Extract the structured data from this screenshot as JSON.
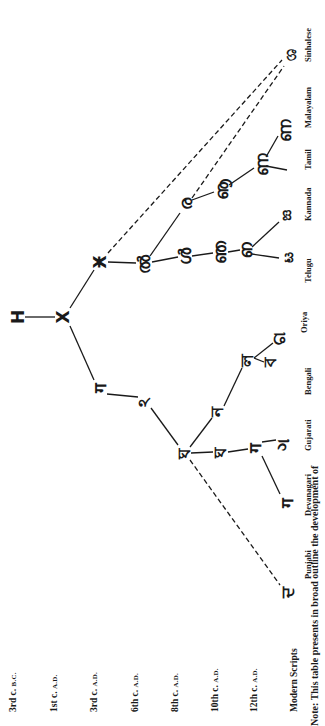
{
  "periods": [
    {
      "era": "3rd c.",
      "suffix": "B.C.",
      "x": 8,
      "y": 712
    },
    {
      "era": "1st c.",
      "suffix": "A.D.",
      "x": 49,
      "y": 712
    },
    {
      "era": "3rd c.",
      "suffix": "A.D.",
      "x": 89,
      "y": 712
    },
    {
      "era": "6th c.",
      "suffix": "A.D.",
      "x": 130,
      "y": 712
    },
    {
      "era": "8th c.",
      "suffix": "A.D.",
      "x": 170,
      "y": 712
    },
    {
      "era": "10th c.",
      "suffix": "A.D.",
      "x": 210,
      "y": 712
    },
    {
      "era": "12th c.",
      "suffix": "A.D.",
      "x": 249,
      "y": 712
    }
  ],
  "modern_label": "Modern Scripts",
  "modern_scripts": [
    {
      "name": "Sinhalese",
      "x": 303,
      "y": 62
    },
    {
      "name": "Malayalam",
      "x": 303,
      "y": 128
    },
    {
      "name": "Tamil",
      "x": 303,
      "y": 170
    },
    {
      "name": "Kannada",
      "x": 303,
      "y": 221
    },
    {
      "name": "Telugu",
      "x": 303,
      "y": 283
    },
    {
      "name": "Oriya",
      "x": 299,
      "y": 333
    },
    {
      "name": "Bengali",
      "x": 303,
      "y": 395
    },
    {
      "name": "Gujarati",
      "x": 303,
      "y": 451
    },
    {
      "name": "Devanagari",
      "x": 303,
      "y": 516
    },
    {
      "name": "Punjabi",
      "x": 303,
      "y": 579
    }
  ],
  "glyphs": [
    {
      "id": "brahmi-3bc",
      "char": "H",
      "x": 18,
      "y": 317
    },
    {
      "id": "brahmi-1ad",
      "char": "X",
      "x": 63,
      "y": 317
    },
    {
      "id": "south-3ad",
      "char": "Ӿ",
      "x": 100,
      "y": 262
    },
    {
      "id": "south-6ad",
      "char": "ൽ",
      "x": 144,
      "y": 264
    },
    {
      "id": "telugu-8ad",
      "char": "ൾ",
      "x": 185,
      "y": 256
    },
    {
      "id": "telugu-10ad",
      "char": "ഞ",
      "x": 220,
      "y": 252
    },
    {
      "id": "telugu-12ad",
      "char": "ഩ",
      "x": 246,
      "y": 250
    },
    {
      "id": "telugu-modern",
      "char": "ಟ",
      "x": 287,
      "y": 257
    },
    {
      "id": "kannada-modern",
      "char": "ಙ",
      "x": 285,
      "y": 215
    },
    {
      "id": "tamil-grantha-8ad",
      "char": "ര",
      "x": 186,
      "y": 204
    },
    {
      "id": "tamil-10ad",
      "char": "ൡ",
      "x": 222,
      "y": 189
    },
    {
      "id": "tamil-12ad",
      "char": "ണ",
      "x": 262,
      "y": 164
    },
    {
      "id": "malayalam-modern",
      "char": "ണ",
      "x": 285,
      "y": 130
    },
    {
      "id": "sinhalese-modern",
      "char": "ශ",
      "x": 290,
      "y": 55
    },
    {
      "id": "north-3ad",
      "char": "ग",
      "x": 100,
      "y": 388
    },
    {
      "id": "north-6ad",
      "char": "ঽ",
      "x": 144,
      "y": 402
    },
    {
      "id": "siddham-8ad",
      "char": "ঘ",
      "x": 184,
      "y": 453
    },
    {
      "id": "nagari-10ad",
      "char": "ঘ",
      "x": 220,
      "y": 452
    },
    {
      "id": "nagari-12ad",
      "char": "ग",
      "x": 255,
      "y": 448
    },
    {
      "id": "devanagari-modern",
      "char": "ग",
      "x": 287,
      "y": 503
    },
    {
      "id": "gujarati-modern",
      "char": "ગ",
      "x": 283,
      "y": 445
    },
    {
      "id": "bengali-10ad",
      "char": "ন",
      "x": 217,
      "y": 412
    },
    {
      "id": "bengali-12ad",
      "char": "ল",
      "x": 247,
      "y": 360
    },
    {
      "id": "bengali-modern",
      "char": "ব",
      "x": 270,
      "y": 362
    },
    {
      "id": "oriya-modern",
      "char": "ଗ",
      "x": 279,
      "y": 338
    },
    {
      "id": "punjabi-modern",
      "char": "ਦ",
      "x": 287,
      "y": 592
    }
  ],
  "edges": [
    {
      "from": [
        25,
        317
      ],
      "to": [
        55,
        317
      ],
      "dashed": false
    },
    {
      "from": [
        70,
        308
      ],
      "to": [
        94,
        270
      ],
      "dashed": false
    },
    {
      "from": [
        70,
        326
      ],
      "to": [
        94,
        380
      ],
      "dashed": false
    },
    {
      "from": [
        108,
        262
      ],
      "to": [
        136,
        263
      ],
      "dashed": false
    },
    {
      "from": [
        152,
        262
      ],
      "to": [
        178,
        257
      ],
      "dashed": false
    },
    {
      "from": [
        150,
        256
      ],
      "to": [
        180,
        213
      ],
      "dashed": false
    },
    {
      "from": [
        192,
        256
      ],
      "to": [
        213,
        253
      ],
      "dashed": false
    },
    {
      "from": [
        228,
        252
      ],
      "to": [
        240,
        250
      ],
      "dashed": false
    },
    {
      "from": [
        252,
        254
      ],
      "to": [
        279,
        258
      ],
      "dashed": false
    },
    {
      "from": [
        252,
        247
      ],
      "to": [
        279,
        222
      ],
      "dashed": false
    },
    {
      "from": [
        192,
        200
      ],
      "to": [
        214,
        192
      ],
      "dashed": false
    },
    {
      "from": [
        229,
        185
      ],
      "to": [
        254,
        168
      ],
      "dashed": false
    },
    {
      "from": [
        266,
        157
      ],
      "to": [
        278,
        136
      ],
      "dashed": false
    },
    {
      "from": [
        266,
        166
      ],
      "to": [
        287,
        170
      ],
      "dashed": false
    },
    {
      "from": [
        108,
        253
      ],
      "to": [
        282,
        60
      ],
      "dashed": true
    },
    {
      "from": [
        192,
        198
      ],
      "to": [
        284,
        66
      ],
      "dashed": true
    },
    {
      "from": [
        107,
        394
      ],
      "to": [
        138,
        397
      ],
      "dashed": false
    },
    {
      "from": [
        151,
        408
      ],
      "to": [
        178,
        445
      ],
      "dashed": false
    },
    {
      "from": [
        190,
        447
      ],
      "to": [
        212,
        418
      ],
      "dashed": false
    },
    {
      "from": [
        224,
        406
      ],
      "to": [
        242,
        368
      ],
      "dashed": false
    },
    {
      "from": [
        254,
        358
      ],
      "to": [
        264,
        362
      ],
      "dashed": false
    },
    {
      "from": [
        254,
        358
      ],
      "to": [
        273,
        343
      ],
      "dashed": false
    },
    {
      "from": [
        191,
        453
      ],
      "to": [
        213,
        452
      ],
      "dashed": false
    },
    {
      "from": [
        228,
        452
      ],
      "to": [
        248,
        449
      ],
      "dashed": false
    },
    {
      "from": [
        262,
        442
      ],
      "to": [
        276,
        440
      ],
      "dashed": false
    },
    {
      "from": [
        262,
        456
      ],
      "to": [
        280,
        494
      ],
      "dashed": false
    },
    {
      "from": [
        190,
        460
      ],
      "to": [
        280,
        585
      ],
      "dashed": true
    }
  ],
  "note": "Note: This table presents in broad outline the development of"
}
